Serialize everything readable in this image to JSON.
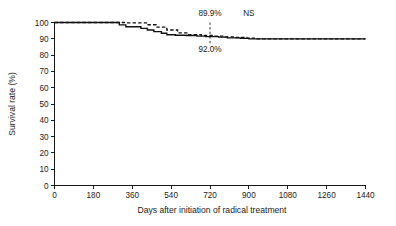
{
  "chart_data": {
    "type": "line",
    "title": "",
    "subtitle": "",
    "xlabel": "Days after initiation of radical treatment",
    "ylabel": "Survival rate (%)",
    "xlim": [
      0,
      1440
    ],
    "ylim": [
      0,
      100
    ],
    "xticks": [
      0,
      180,
      360,
      540,
      720,
      900,
      1080,
      1260,
      1440
    ],
    "xtick_labels": [
      "0",
      "180",
      "360",
      "540",
      "720",
      "900",
      "1080",
      "1260",
      "1440"
    ],
    "yticks": [
      0,
      10,
      20,
      30,
      40,
      50,
      60,
      70,
      80,
      90,
      100
    ],
    "ytick_labels": [
      "0",
      "10",
      "20",
      "30",
      "40",
      "50",
      "60",
      "70",
      "80",
      "90",
      "100"
    ],
    "grid": false,
    "legend": "none",
    "series": [
      {
        "name": "solid-curve",
        "style": "solid",
        "color": "#111111",
        "x": [
          0,
          300,
          300,
          330,
          330,
          400,
          400,
          430,
          430,
          460,
          460,
          495,
          495,
          520,
          520,
          560,
          560,
          610,
          610,
          660,
          660,
          700,
          700,
          760,
          760,
          800,
          800,
          860,
          860,
          900,
          900,
          1440
        ],
        "y": [
          100,
          100,
          98.5,
          98.5,
          97.4,
          97.4,
          96.4,
          96.4,
          95.4,
          95.4,
          94.4,
          94.4,
          93.4,
          93.4,
          92.5,
          92.5,
          92.2,
          92.2,
          92.0,
          92.0,
          91.6,
          91.6,
          91.3,
          91.3,
          91.0,
          91.0,
          90.6,
          90.6,
          90.3,
          90.3,
          90.0,
          90.0
        ]
      },
      {
        "name": "dashed-curve",
        "style": "dashed",
        "color": "#111111",
        "x": [
          0,
          330,
          330,
          430,
          430,
          470,
          470,
          520,
          520,
          570,
          570,
          620,
          620,
          680,
          680,
          730,
          730,
          790,
          790,
          840,
          840,
          890,
          890,
          930,
          930,
          1440
        ],
        "y": [
          100,
          100,
          99.8,
          99.8,
          98.6,
          98.6,
          97.2,
          97.2,
          95.4,
          95.4,
          93.6,
          93.6,
          92.6,
          92.6,
          92.0,
          92.0,
          91.6,
          91.6,
          91.2,
          91.2,
          90.8,
          90.8,
          90.4,
          90.4,
          90.0,
          90.0
        ]
      }
    ],
    "reference_line": {
      "name": "day-720-marker",
      "x": 720,
      "y_top": 100,
      "y_bottom": 86,
      "style": "dotted"
    },
    "annotations": [
      {
        "name": "upper-survival-label",
        "text": "89.9%",
        "x": 720,
        "y": 104,
        "align": "center"
      },
      {
        "name": "lower-survival-label",
        "text": "92.0%",
        "x": 720,
        "y": 82,
        "align": "center"
      },
      {
        "name": "significance-label",
        "text": "NS",
        "x": 900,
        "y": 104,
        "align": "center"
      }
    ]
  }
}
